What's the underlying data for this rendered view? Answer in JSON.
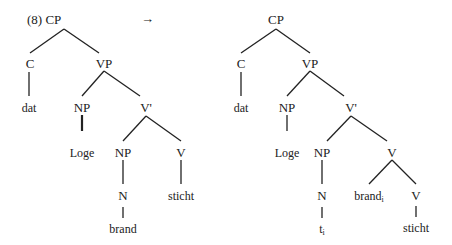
{
  "example_number": "(8)",
  "arrow": "→",
  "left_tree": {
    "root": "CP",
    "c": "C",
    "c_word": "dat",
    "vp": "VP",
    "np_subj": "NP",
    "np_subj_word": "Loge",
    "vbar": "V'",
    "np_obj": "NP",
    "n": "N",
    "n_word": "brand",
    "v": "V",
    "v_word": "sticht"
  },
  "right_tree": {
    "root": "CP",
    "c": "C",
    "c_word": "dat",
    "vp": "VP",
    "np_subj": "NP",
    "np_subj_word": "Loge",
    "vbar": "V'",
    "np_obj": "NP",
    "n": "N",
    "trace": "t",
    "trace_index": "i",
    "v_complex": "V",
    "incorporated": "brand",
    "incorporated_index": "i",
    "v": "V",
    "v_word": "sticht"
  },
  "colors": {
    "line": "#222222",
    "text": "#222222",
    "background": "#ffffff"
  }
}
